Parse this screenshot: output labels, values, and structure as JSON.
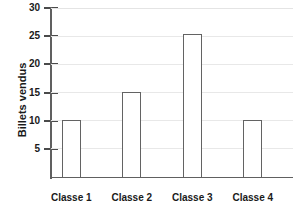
{
  "chart_data": {
    "type": "bar",
    "title": "",
    "xlabel": "",
    "ylabel": "Billets vendus",
    "categories": [
      "Classe 1",
      "Classe 2",
      "Classe 3",
      "Classe 4"
    ],
    "values": [
      10.2,
      15.1,
      25.3,
      10.2
    ],
    "ylim": [
      0,
      30
    ],
    "yticks": [
      5,
      10,
      15,
      20,
      25,
      30
    ],
    "ytick_labels": [
      "5",
      "10",
      "15",
      "20",
      "25",
      "30"
    ],
    "grid": true,
    "legend": false,
    "colors": {
      "bar_fill": "#ffffff",
      "bar_stroke": "#636363",
      "gridline": "#e8e8e8",
      "axis": "#606060",
      "text": "#1a1a1a",
      "background": "#ffffff"
    }
  },
  "axis": {
    "y_title": "Billets vendus"
  }
}
